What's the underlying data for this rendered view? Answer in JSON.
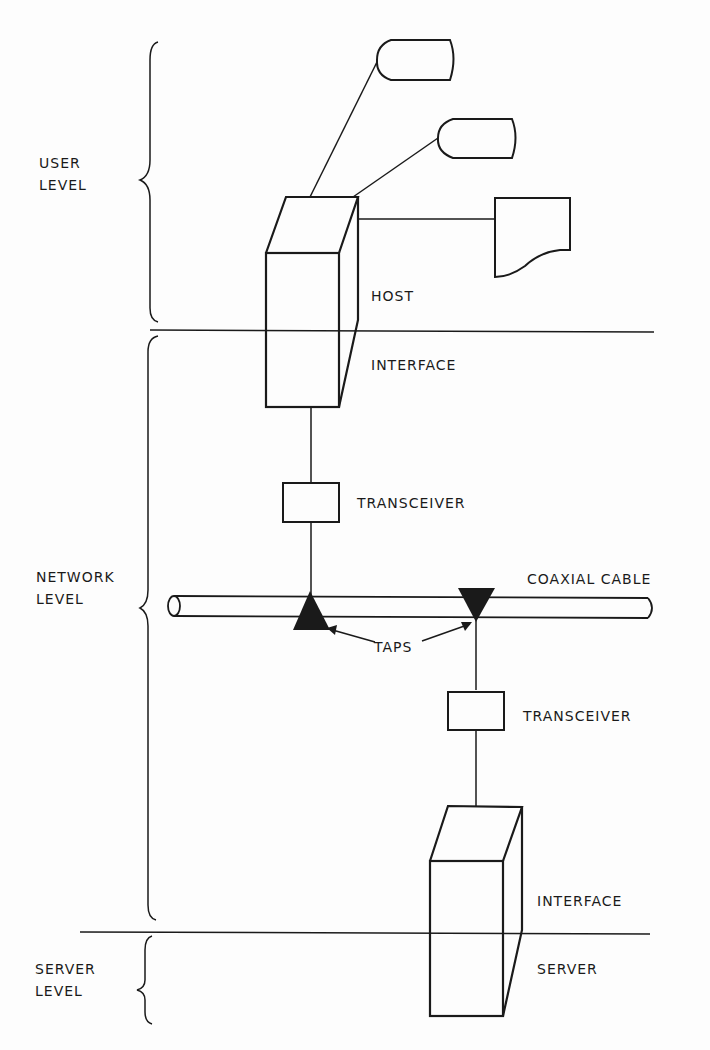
{
  "levels": {
    "user": [
      "USER",
      "LEVEL"
    ],
    "network": [
      "NETWORK",
      "LEVEL"
    ],
    "server": [
      "SERVER",
      "LEVEL"
    ]
  },
  "labels": {
    "host": "HOST",
    "host_interface": "INTERFACE",
    "transceiver_top": "TRANSCEIVER",
    "coaxial_cable": "COAXIAL CABLE",
    "taps": "TAPS",
    "transceiver_bottom": "TRANSCEIVER",
    "server_interface": "INTERFACE",
    "server": "SERVER"
  },
  "colors": {
    "ink": "#1a1a1a",
    "background": "#fdfdfd"
  }
}
